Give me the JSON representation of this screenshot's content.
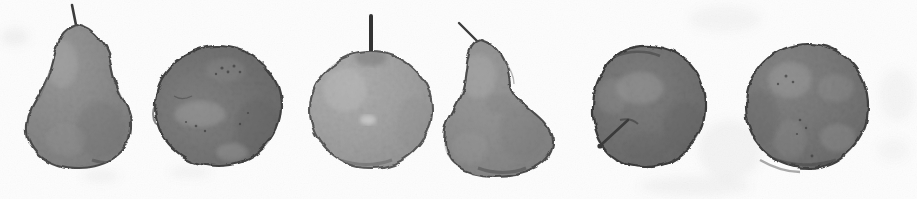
{
  "artwork": {
    "title": "Six Fruit Studies",
    "medium": "greyscale watercolour wash on white paper",
    "orientation": "horizontal row",
    "canvas": {
      "width": 917,
      "height": 199
    },
    "background_color": "#fdfdfd",
    "paper_texture_color": "#f0f0f0",
    "palette": {
      "lightest_fill": "#a8a8a8",
      "mid_fill": "#8a8a8a",
      "dark_fill": "#757575",
      "darkest_fill": "#6b6b6b",
      "outline": "#4a4a4a",
      "stem": "#3a3a3a",
      "highlight": "#c9c9c9",
      "shadow_blot": "#5e5e5e"
    }
  },
  "subjects": [
    {
      "index": 1,
      "name": "pear-left",
      "kind": "pear",
      "label": "Pear",
      "tone": "mid grey",
      "fill": "#8e8e8e",
      "fill_dark": "#7d7d7d",
      "outline": "#4c4c4c",
      "bbox": {
        "x": 25,
        "y": 22,
        "w": 108,
        "h": 146
      },
      "stem": {
        "x1": 77,
        "y1": 28,
        "x2": 72,
        "y2": 5,
        "width": 2.6,
        "color": "#3c3c3c"
      },
      "highlight": {
        "cx": 60,
        "cy": 62,
        "rx": 18,
        "ry": 26
      }
    },
    {
      "index": 2,
      "name": "apple-dark-second",
      "kind": "apple",
      "label": "Apple",
      "tone": "dark grey",
      "fill": "#787878",
      "fill_dark": "#656565",
      "outline": "#3f3f3f",
      "bbox": {
        "x": 155,
        "y": 46,
        "w": 126,
        "h": 120
      },
      "stem": null,
      "highlight": {
        "cx": 200,
        "cy": 112,
        "rx": 26,
        "ry": 16
      }
    },
    {
      "index": 3,
      "name": "apple-light-third",
      "kind": "apple",
      "label": "Apple",
      "tone": "light grey",
      "fill": "#a4a4a4",
      "fill_dark": "#949494",
      "outline": "#545454",
      "bbox": {
        "x": 310,
        "y": 52,
        "w": 122,
        "h": 116
      },
      "stem": {
        "x1": 371,
        "y1": 58,
        "x2": 371,
        "y2": 16,
        "width": 4.0,
        "color": "#333333"
      },
      "highlight": {
        "cx": 345,
        "cy": 88,
        "rx": 22,
        "ry": 22
      }
    },
    {
      "index": 4,
      "name": "pear-fourth",
      "kind": "pear",
      "label": "Pear",
      "tone": "mid grey",
      "fill": "#919191",
      "fill_dark": "#7f7f7f",
      "outline": "#4c4c4c",
      "bbox": {
        "x": 443,
        "y": 36,
        "w": 110,
        "h": 140
      },
      "stem": {
        "x1": 480,
        "y1": 44,
        "x2": 459,
        "y2": 23,
        "width": 2.4,
        "color": "#3c3c3c"
      },
      "highlight": {
        "cx": 478,
        "cy": 74,
        "rx": 20,
        "ry": 24
      }
    },
    {
      "index": 5,
      "name": "apple-dark-fifth",
      "kind": "apple",
      "label": "Apple",
      "tone": "dark grey",
      "fill": "#757575",
      "fill_dark": "#606060",
      "outline": "#3b3b3b",
      "bbox": {
        "x": 592,
        "y": 46,
        "w": 114,
        "h": 122
      },
      "stem": {
        "x1": 628,
        "y1": 120,
        "x2": 600,
        "y2": 146,
        "width": 2.6,
        "color": "#3a3a3a"
      },
      "highlight": {
        "cx": 640,
        "cy": 90,
        "rx": 24,
        "ry": 18
      }
    },
    {
      "index": 6,
      "name": "apple-dark-sixth",
      "kind": "apple",
      "label": "Apple",
      "tone": "dark grey",
      "fill": "#7a7a7a",
      "fill_dark": "#666666",
      "outline": "#3f3f3f",
      "bbox": {
        "x": 746,
        "y": 44,
        "w": 122,
        "h": 124
      },
      "stem": null,
      "highlight": {
        "cx": 790,
        "cy": 82,
        "rx": 22,
        "ry": 20
      }
    }
  ],
  "background_marks": [
    {
      "name": "smudge-left",
      "x": 2,
      "y": 28,
      "w": 26,
      "h": 18,
      "opacity": 0.1
    },
    {
      "name": "smudge-pear1-left",
      "x": 30,
      "y": 118,
      "w": 22,
      "h": 16,
      "opacity": 0.1
    },
    {
      "name": "smudge-pear1-below",
      "x": 84,
      "y": 170,
      "w": 34,
      "h": 12,
      "opacity": 0.09
    },
    {
      "name": "smudge-apple2-below",
      "x": 170,
      "y": 166,
      "w": 40,
      "h": 12,
      "opacity": 0.08
    },
    {
      "name": "smudge-upper-right",
      "x": 690,
      "y": 6,
      "w": 70,
      "h": 26,
      "opacity": 0.07
    },
    {
      "name": "smudge-right-band",
      "x": 700,
      "y": 120,
      "w": 60,
      "h": 60,
      "opacity": 0.08
    },
    {
      "name": "smudge-bottom-center",
      "x": 640,
      "y": 176,
      "w": 110,
      "h": 20,
      "opacity": 0.08
    },
    {
      "name": "smudge-far-right",
      "x": 880,
      "y": 70,
      "w": 34,
      "h": 50,
      "opacity": 0.07
    }
  ]
}
